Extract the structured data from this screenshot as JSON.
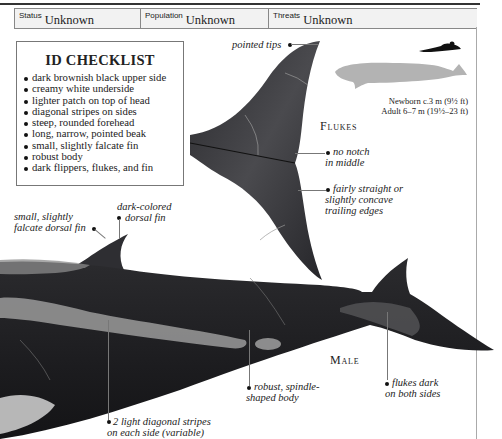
{
  "status_bar": {
    "status": {
      "label": "Status",
      "value": "Unknown"
    },
    "population": {
      "label": "Population",
      "value": "Unknown"
    },
    "threats": {
      "label": "Threats",
      "value": "Unknown"
    }
  },
  "checklist": {
    "title": "ID CHECKLIST",
    "items": [
      "dark brownish black upper side",
      "creamy white underside",
      "lighter patch on top of head",
      "diagonal stripes on sides",
      "steep, rounded forehead",
      "long, narrow, pointed beak",
      "small, slightly falcate fin",
      "robust body",
      "dark flippers, flukes, and fin"
    ]
  },
  "size_comparison": {
    "newborn": "Newborn c.3 m (9½ ft)",
    "adult": "Adult 6–7 m (19½–23 ft)"
  },
  "flukes": {
    "heading": "Flukes",
    "annotations": {
      "tips": "pointed tips",
      "notch_1": "no notch",
      "notch_2": "in middle",
      "trailing_1": "fairly straight or",
      "trailing_2": "slightly concave",
      "trailing_3": "trailing edges"
    }
  },
  "male": {
    "heading": "Male",
    "annotations": {
      "fin_1": "small, slightly",
      "fin_2": "falcate dorsal fin",
      "dark_fin_1": "dark-colored",
      "dark_fin_2": "dorsal fin",
      "body_1": "robust, spindle-",
      "body_2": "shaped body",
      "flukes_1": "flukes dark",
      "flukes_2": "on both sides",
      "stripes_1": "2 light diagonal stripes",
      "stripes_2": "on each side (variable)"
    }
  },
  "colors": {
    "whale_dark": "#1f1f22",
    "whale_stripe": "#8d8d8d",
    "silhouette": "#b3b3b3"
  }
}
